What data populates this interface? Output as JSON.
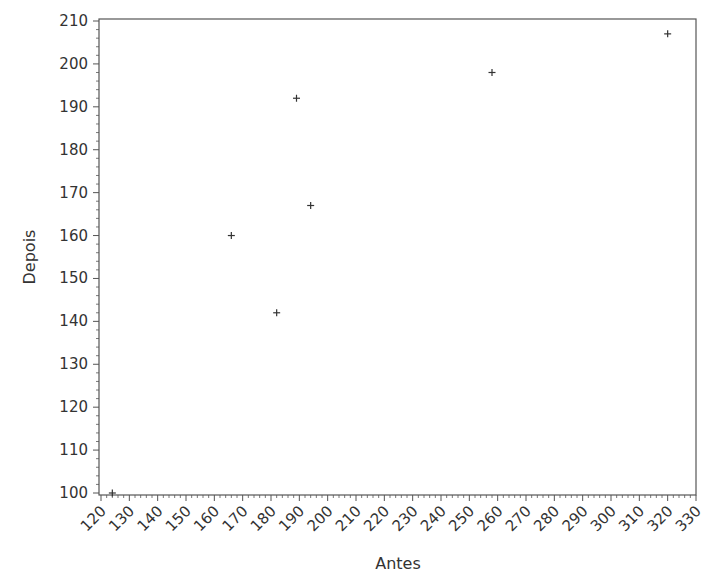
{
  "chart_data": {
    "type": "scatter",
    "title": "",
    "xlabel": "Antes",
    "ylabel": "Depois",
    "xlim": [
      120,
      330
    ],
    "ylim": [
      100,
      210
    ],
    "xticks": [
      120,
      130,
      140,
      150,
      160,
      170,
      180,
      190,
      200,
      210,
      220,
      230,
      240,
      250,
      260,
      270,
      280,
      290,
      300,
      310,
      320,
      330
    ],
    "yticks": [
      100,
      110,
      120,
      130,
      140,
      150,
      160,
      170,
      180,
      190,
      200,
      210
    ],
    "marker": "+",
    "grid": false,
    "legend": null,
    "series": [
      {
        "name": "Depois vs Antes",
        "points": [
          {
            "x": 124,
            "y": 100
          },
          {
            "x": 166,
            "y": 160
          },
          {
            "x": 182,
            "y": 142
          },
          {
            "x": 189,
            "y": 192
          },
          {
            "x": 194,
            "y": 167
          },
          {
            "x": 258,
            "y": 198
          },
          {
            "x": 320,
            "y": 207
          }
        ]
      }
    ]
  },
  "colors": {
    "axis": "#555555",
    "marker": "#333333",
    "text": "#333333"
  }
}
